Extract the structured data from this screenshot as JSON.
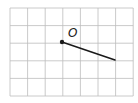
{
  "diagram": {
    "grid": {
      "left": 10,
      "top": 8,
      "cols": 7,
      "rows": 5,
      "cell": 17.6,
      "line_color": "#bdbdbd"
    },
    "ray": {
      "origin": {
        "x": 62,
        "y": 42
      },
      "end": {
        "x": 115,
        "y": 60
      },
      "color": "#1a1a1a"
    },
    "point_label": "O",
    "label_pos": {
      "x": 68,
      "y": 27
    }
  }
}
